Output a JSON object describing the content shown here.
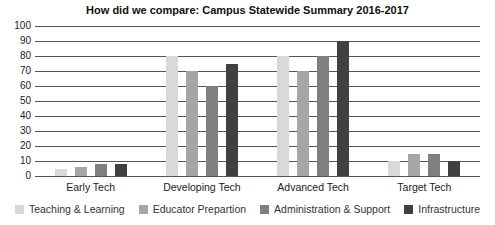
{
  "chart_data": {
    "type": "bar",
    "title": "How did we compare: Campus Statewide Summary 2016-2017",
    "xlabel": "",
    "ylabel": "",
    "ylim": [
      0,
      100
    ],
    "yticks": [
      0,
      10,
      20,
      30,
      40,
      50,
      60,
      70,
      80,
      90,
      100
    ],
    "grid": true,
    "legend_position": "bottom",
    "categories": [
      "Early Tech",
      "Developing Tech",
      "Advanced Tech",
      "Target Tech"
    ],
    "series": [
      {
        "name": "Teaching & Learning",
        "color": "#d9d9d9",
        "values": [
          5,
          80,
          80,
          10
        ]
      },
      {
        "name": "Educator Prepartion",
        "color": "#a6a6a6",
        "values": [
          6,
          70,
          70,
          15
        ]
      },
      {
        "name": "Administration & Support",
        "color": "#7f7f7f",
        "values": [
          8,
          60,
          80,
          15
        ]
      },
      {
        "name": "Infrastructure",
        "color": "#404040",
        "values": [
          8,
          75,
          90,
          10
        ]
      }
    ]
  }
}
